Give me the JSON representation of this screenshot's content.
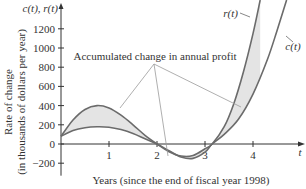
{
  "chart_data": {
    "type": "line",
    "title": "",
    "xlabel": "Years (since the end of fiscal year 1998)",
    "ylabel_line1": "Rate of change",
    "ylabel_line2": "(in thousands of dollars per year)",
    "y_axis_name": "c(t), r(t)",
    "x_axis_name": "t",
    "xlim": [
      0,
      5
    ],
    "ylim": [
      -300,
      1500
    ],
    "x_ticks": [
      1,
      2,
      3,
      4
    ],
    "x_tick_labels": [
      "1",
      "2",
      "3",
      "4"
    ],
    "y_ticks": [
      -200,
      0,
      200,
      400,
      600,
      800,
      1000,
      1200
    ],
    "y_tick_labels": [
      "−200",
      "0",
      "200",
      "400",
      "600",
      "800",
      "1000",
      "1200"
    ],
    "grid": false,
    "annotation": "Accumulated change in annual profit",
    "series": [
      {
        "name": "r(t)",
        "label": "r(t)",
        "x": [
          0,
          0.25,
          0.5,
          0.75,
          1.0,
          1.25,
          1.5,
          1.75,
          2.0,
          2.25,
          2.5,
          2.75,
          3.0,
          3.15,
          3.4,
          3.6,
          3.8,
          4.0,
          4.15
        ],
        "y": [
          80,
          250,
          360,
          400,
          375,
          300,
          200,
          90,
          0,
          -80,
          -125,
          -120,
          -50,
          0,
          180,
          420,
          750,
          1150,
          1500
        ]
      },
      {
        "name": "c(t)",
        "label": "c(t)",
        "x": [
          0,
          0.25,
          0.5,
          0.75,
          1.0,
          1.25,
          1.5,
          1.75,
          2.0,
          2.25,
          2.5,
          2.75,
          3.0,
          3.15,
          3.4,
          3.7,
          4.0,
          4.3,
          4.5,
          4.7
        ],
        "y": [
          80,
          140,
          170,
          180,
          175,
          150,
          110,
          55,
          0,
          -70,
          -135,
          -150,
          -85,
          0,
          100,
          260,
          520,
          880,
          1180,
          1500
        ]
      }
    ]
  },
  "colors": {
    "curve": "#6b6b6b",
    "fill": "#e4e4e4",
    "axis": "#333333",
    "annotation_line": "#9a9a9a"
  }
}
